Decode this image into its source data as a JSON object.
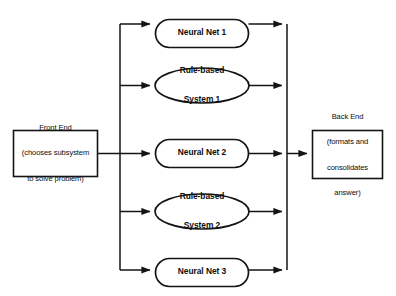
{
  "diagram": {
    "type": "block-flow-diagram",
    "stroke_color": "#141414",
    "fill_color": "#ffffff",
    "background_color": "#ffffff",
    "front_end": {
      "shape": "rectangle",
      "lines": [
        "Front End",
        "(chooses subsystem",
        "to solve problem)"
      ],
      "text": "Front End (chooses subsystem to solve problem)"
    },
    "back_end": {
      "shape": "rectangle",
      "lines": [
        "Back End",
        "(formats and",
        "consolidates",
        "answer)"
      ],
      "text": "Back End (formats and consolidates answer)"
    },
    "subsystems": [
      {
        "id": "neural-net-1",
        "shape": "stadium",
        "lines": [
          "Neural Net 1"
        ],
        "text": "Neural Net 1"
      },
      {
        "id": "rule-based-system-1",
        "shape": "ellipse",
        "lines": [
          "Rule-based",
          "System 1"
        ],
        "text": "Rule-based System 1"
      },
      {
        "id": "neural-net-2",
        "shape": "stadium",
        "lines": [
          "Neural Net 2"
        ],
        "text": "Neural Net 2"
      },
      {
        "id": "rule-based-system-2",
        "shape": "ellipse",
        "lines": [
          "Rule-based",
          "System 2"
        ],
        "text": "Rule-based System 2"
      },
      {
        "id": "neural-net-3",
        "shape": "stadium",
        "lines": [
          "Neural Net 3"
        ],
        "text": "Neural Net 3"
      }
    ],
    "connections": {
      "front_end_to_bus": "Front End output feeds a vertical distribution bus",
      "bus_to_subsystems": "Distribution bus branches into all five subsystems",
      "subsystems_to_bus": "All five subsystems feed a vertical collection bus",
      "bus_to_back_end": "Collection bus feeds the Back End"
    }
  }
}
